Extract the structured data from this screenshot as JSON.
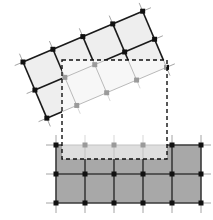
{
  "figure": {
    "type": "diagram",
    "canvas": {
      "width": 213,
      "height": 220,
      "background": "#ffffff"
    }
  },
  "colors": {
    "background": "#ffffff",
    "rotated_grid_fill": "#eeeeee",
    "rotated_grid_line": "#1a1a1a",
    "rotated_grid_line_faded": "#b9b9b9",
    "rotated_grid_fill_faded": "#f7f7f7",
    "bottom_grid_fill": "#a8a8a8",
    "bottom_grid_fill_faded": "#dedede",
    "bottom_grid_line": "#3a3a3a",
    "bottom_grid_line_faded": "#c2c2c2",
    "node_dark": "#111111",
    "node_faded": "#9a9a9a",
    "tick_line": "#9a9a9a",
    "tick_line_faded": "#d2d2d2",
    "dashed_rect_stroke": "#111111"
  },
  "rotated_grid": {
    "name": "rotated-structured-grid",
    "columns": 4,
    "rows": 2,
    "rotation_degrees": -23,
    "origin": {
      "x": 23,
      "y": 62
    },
    "cell_size": {
      "u": 32.5,
      "v": 30.5
    },
    "node_marker": "filled-square",
    "node_size": 5,
    "tick_overhang": 9,
    "fill": "#eeeeee",
    "stroke_width": 1.6
  },
  "bottom_grid": {
    "name": "axis-aligned-structured-grid",
    "columns": 5,
    "rows": 2,
    "origin": {
      "x": 56,
      "y": 145
    },
    "cell_width": 29,
    "cell_height": 29,
    "node_marker": "filled-square",
    "node_size": 5,
    "tick_overhang": 10,
    "fill": "#a8a8a8",
    "stroke_width": 1.6
  },
  "selection_window": {
    "name": "dashed-selection-rectangle",
    "x": 62,
    "y": 60,
    "width": 105,
    "height": 99,
    "stroke": "#111111",
    "stroke_width": 1.4,
    "dash_pattern": "4 3",
    "fill": "none",
    "label": ""
  },
  "legend": {
    "visible": false,
    "entries": []
  },
  "annotations": []
}
